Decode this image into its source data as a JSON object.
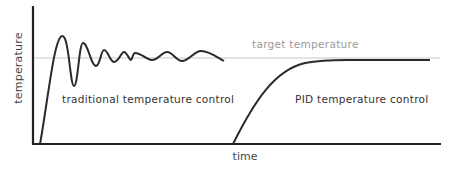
{
  "diagram": {
    "y_axis_label": "temperature",
    "x_axis_label": "time",
    "target_label": "target temperature",
    "traditional_label": "traditional temperature control",
    "pid_label": "PID temperature control",
    "colors": {
      "axis": "#222222",
      "curve": "#2a2a2a",
      "target_line": "#c8c8c8",
      "target_text": "#9a9a9a"
    }
  }
}
